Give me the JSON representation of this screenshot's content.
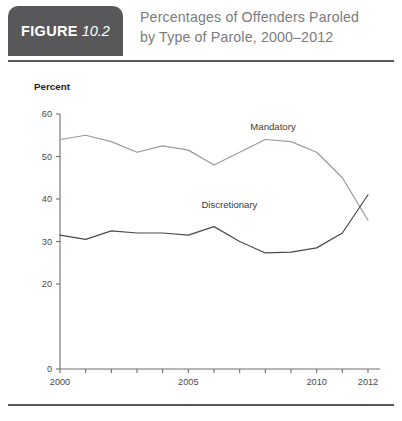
{
  "header": {
    "badge_word": "FIGURE",
    "badge_number": "10.2",
    "title_line1": "Percentages of Offenders Paroled",
    "title_line2": "by Type of Parole, 2000–2012",
    "rule_color": "#58585a",
    "badge_bg": "#58585a"
  },
  "chart_data": {
    "type": "line",
    "title": "Percentages of Offenders Paroled by Type of Parole, 2000–2012",
    "xlabel": "",
    "ylabel": "Percent",
    "ylabel_caption": "Percent",
    "x": [
      2000,
      2001,
      2002,
      2003,
      2004,
      2005,
      2006,
      2007,
      2008,
      2009,
      2010,
      2011,
      2012
    ],
    "xlim": [
      2000,
      2012
    ],
    "ylim": [
      0,
      60
    ],
    "grid": false,
    "legend_position": "inline-annotation",
    "y_ticks": [
      0,
      20,
      30,
      40,
      50,
      60
    ],
    "y_tick_labels": [
      "0",
      "20",
      "30",
      "40",
      "50",
      "60"
    ],
    "x_ticks": [
      2000,
      2001,
      2002,
      2003,
      2004,
      2005,
      2006,
      2007,
      2008,
      2009,
      2010,
      2011,
      2012
    ],
    "x_tick_labels": [
      "2000",
      "",
      "",
      "",
      "",
      "2005",
      "",
      "",
      "",
      "",
      "2010",
      "",
      "2012"
    ],
    "series": [
      {
        "name": "Mandatory",
        "color": "#9a9a9c",
        "label_x": 2008.3,
        "label_y": 56.2,
        "values": [
          54.0,
          55.0,
          53.5,
          51.0,
          52.5,
          51.5,
          48.0,
          51.0,
          54.0,
          53.5,
          51.0,
          45.0,
          35.0
        ]
      },
      {
        "name": "Discretionary",
        "color": "#4a4a4c",
        "label_x": 2006.6,
        "label_y": 38.0,
        "values": [
          31.5,
          30.5,
          32.5,
          32.0,
          32.0,
          31.5,
          33.5,
          30.0,
          27.3,
          27.5,
          28.5,
          32.0,
          41.0
        ]
      }
    ]
  }
}
